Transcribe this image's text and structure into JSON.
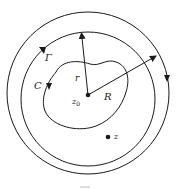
{
  "diagram": {
    "type": "complex-analysis-contour",
    "labels": {
      "gamma": "Γ",
      "c": "C",
      "r": "r",
      "big_r": "R",
      "z0": "z",
      "z0_sub": "0",
      "z": "z"
    },
    "colors": {
      "stroke": "#1a1a1a",
      "background": "#ffffff"
    },
    "elements": [
      {
        "name": "outer-circle",
        "label": "Γ",
        "orientation": "clockwise"
      },
      {
        "name": "inner-circle",
        "orientation": "counterclockwise"
      },
      {
        "name": "inner-curve",
        "label": "C"
      },
      {
        "name": "radius-r",
        "label": "r",
        "from": "z0"
      },
      {
        "name": "radius-R",
        "label": "R",
        "from": "z0"
      },
      {
        "name": "point-z0",
        "label": "z0"
      },
      {
        "name": "point-z",
        "label": "z"
      }
    ]
  }
}
